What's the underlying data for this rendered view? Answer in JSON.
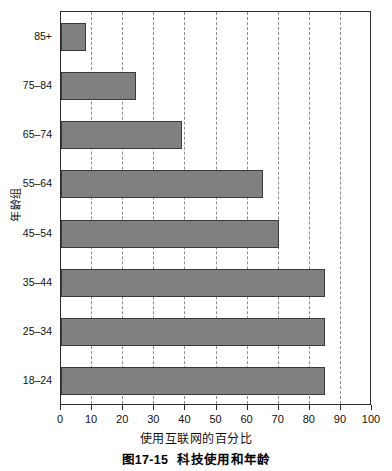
{
  "chart_data": {
    "type": "bar",
    "orientation": "horizontal",
    "title": "",
    "xlabel": "使用互联网的百分比",
    "ylabel": "年龄组",
    "categories": [
      "85+",
      "75–84",
      "65–74",
      "55–64",
      "45–54",
      "35–44",
      "25–34",
      "18–24"
    ],
    "values": [
      8,
      24,
      39,
      65,
      70,
      85,
      85,
      85
    ],
    "xlim": [
      0,
      100
    ],
    "xticks": [
      0,
      10,
      20,
      30,
      40,
      50,
      60,
      70,
      80,
      90,
      100
    ],
    "xtick_labels": [
      "0",
      "10",
      "20",
      "30",
      "40",
      "50",
      "60",
      "70",
      "80",
      "90",
      "100"
    ],
    "grid": "vertical-dashed",
    "legend": "none",
    "bar_color": "#808080",
    "bar_edge_color": "#3a3a3a",
    "axis_color": "#2b2b2b",
    "gridline_color": "#8d8d8d",
    "background": "#ffffff"
  },
  "caption": {
    "number": "图17-15",
    "text": "科技使用和年龄"
  }
}
